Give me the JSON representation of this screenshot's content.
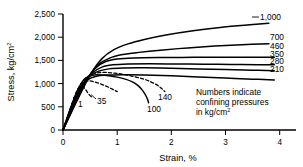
{
  "chart_data": {
    "type": "line",
    "title": "",
    "xlabel": "Strain, %",
    "ylabel": "Stress, kg/cm2",
    "ylabel_base": "Stress, kg/cm",
    "ylabel_sup": "2",
    "xlim": [
      0,
      4.3
    ],
    "ylim": [
      0,
      2600
    ],
    "xticks": [
      0,
      1,
      2,
      3,
      4
    ],
    "xticklabels": [
      "0",
      "1",
      "2",
      "3",
      "4"
    ],
    "yticks": [
      0,
      500,
      1000,
      1500,
      2000,
      2500
    ],
    "yticklabels": [
      "0",
      "500",
      "1,000",
      "1,500",
      "2,000",
      "2,500"
    ],
    "grid": false,
    "legend": "inline-labels-right",
    "annotation": {
      "line1": "Numbers indicate",
      "line2": "confining pressures",
      "line3_base": "in kg/cm",
      "line3_sup": "2"
    },
    "series": [
      {
        "name": "1",
        "label": "1",
        "confining_pressure": 1,
        "style": "dashed",
        "label_position": "inline-left",
        "points": [
          [
            0,
            0
          ],
          [
            0.12,
            420
          ],
          [
            0.2,
            700
          ],
          [
            0.26,
            880
          ],
          [
            0.3,
            950
          ],
          [
            0.34,
            980
          ],
          [
            0.38,
            960
          ],
          [
            0.42,
            900
          ],
          [
            0.46,
            830
          ],
          [
            0.5,
            770
          ],
          [
            0.54,
            730
          ]
        ]
      },
      {
        "name": "35",
        "label": "35",
        "confining_pressure": 35,
        "style": "dashed",
        "label_position": "inline-left",
        "points": [
          [
            0,
            0
          ],
          [
            0.14,
            500
          ],
          [
            0.24,
            830
          ],
          [
            0.32,
            1010
          ],
          [
            0.4,
            1080
          ],
          [
            0.48,
            1100
          ],
          [
            0.58,
            1080
          ],
          [
            0.7,
            1030
          ],
          [
            0.82,
            970
          ],
          [
            0.92,
            910
          ],
          [
            1.0,
            860
          ]
        ]
      },
      {
        "name": "100",
        "label": "100",
        "confining_pressure": 100,
        "style": "solid",
        "label_position": "inline-mid",
        "points": [
          [
            0,
            0
          ],
          [
            0.16,
            560
          ],
          [
            0.28,
            920
          ],
          [
            0.38,
            1120
          ],
          [
            0.48,
            1200
          ],
          [
            0.58,
            1235
          ],
          [
            0.7,
            1235
          ],
          [
            0.85,
            1215
          ],
          [
            1.0,
            1185
          ],
          [
            1.15,
            1140
          ],
          [
            1.28,
            1080
          ],
          [
            1.38,
            1000
          ],
          [
            1.46,
            900
          ],
          [
            1.52,
            790
          ],
          [
            1.56,
            690
          ],
          [
            1.58,
            610
          ]
        ]
      },
      {
        "name": "140",
        "label": "140",
        "confining_pressure": 140,
        "style": "dashed",
        "label_position": "inline-mid",
        "points": [
          [
            0,
            0
          ],
          [
            0.18,
            600
          ],
          [
            0.3,
            960
          ],
          [
            0.42,
            1160
          ],
          [
            0.54,
            1250
          ],
          [
            0.66,
            1285
          ],
          [
            0.8,
            1290
          ],
          [
            0.95,
            1275
          ],
          [
            1.12,
            1245
          ],
          [
            1.3,
            1200
          ],
          [
            1.48,
            1145
          ],
          [
            1.62,
            1080
          ],
          [
            1.74,
            1005
          ],
          [
            1.82,
            930
          ],
          [
            1.88,
            860
          ]
        ]
      },
      {
        "name": "210",
        "label": "210",
        "confining_pressure": 210,
        "style": "solid",
        "label_position": "right",
        "points": [
          [
            0,
            0
          ],
          [
            0.2,
            640
          ],
          [
            0.34,
            980
          ],
          [
            0.46,
            1130
          ],
          [
            0.6,
            1200
          ],
          [
            0.8,
            1230
          ],
          [
            1.1,
            1240
          ],
          [
            1.5,
            1235
          ],
          [
            2.0,
            1215
          ],
          [
            2.5,
            1190
          ],
          [
            3.0,
            1165
          ],
          [
            3.5,
            1140
          ],
          [
            3.9,
            1120
          ]
        ]
      },
      {
        "name": "280",
        "label": "280",
        "confining_pressure": 280,
        "style": "solid",
        "label_position": "right",
        "points": [
          [
            0,
            0
          ],
          [
            0.22,
            680
          ],
          [
            0.36,
            1030
          ],
          [
            0.5,
            1220
          ],
          [
            0.66,
            1320
          ],
          [
            0.85,
            1370
          ],
          [
            1.1,
            1390
          ],
          [
            1.5,
            1395
          ],
          [
            2.0,
            1385
          ],
          [
            2.5,
            1370
          ],
          [
            3.0,
            1355
          ],
          [
            3.5,
            1340
          ],
          [
            3.9,
            1330
          ]
        ]
      },
      {
        "name": "350",
        "label": "350",
        "confining_pressure": 350,
        "style": "solid",
        "label_position": "right",
        "points": [
          [
            0,
            0
          ],
          [
            0.24,
            700
          ],
          [
            0.4,
            1080
          ],
          [
            0.55,
            1290
          ],
          [
            0.72,
            1410
          ],
          [
            0.92,
            1460
          ],
          [
            1.2,
            1480
          ],
          [
            1.6,
            1485
          ],
          [
            2.1,
            1480
          ],
          [
            2.6,
            1475
          ],
          [
            3.1,
            1470
          ],
          [
            3.6,
            1465
          ],
          [
            3.9,
            1462
          ]
        ]
      },
      {
        "name": "460",
        "label": "460",
        "confining_pressure": 460,
        "style": "solid",
        "label_position": "right",
        "points": [
          [
            0,
            0
          ],
          [
            0.26,
            720
          ],
          [
            0.44,
            1140
          ],
          [
            0.6,
            1390
          ],
          [
            0.78,
            1530
          ],
          [
            1.0,
            1590
          ],
          [
            1.3,
            1615
          ],
          [
            1.8,
            1625
          ],
          [
            2.4,
            1628
          ],
          [
            3.0,
            1628
          ],
          [
            3.5,
            1628
          ],
          [
            3.9,
            1628
          ]
        ]
      },
      {
        "name": "700",
        "label": "700",
        "confining_pressure": 700,
        "style": "solid",
        "label_position": "right",
        "points": [
          [
            0,
            0
          ],
          [
            0.28,
            740
          ],
          [
            0.48,
            1200
          ],
          [
            0.66,
            1470
          ],
          [
            0.86,
            1610
          ],
          [
            1.1,
            1690
          ],
          [
            1.4,
            1740
          ],
          [
            1.8,
            1790
          ],
          [
            2.3,
            1840
          ],
          [
            2.8,
            1880
          ],
          [
            3.3,
            1910
          ],
          [
            3.8,
            1935
          ]
        ]
      },
      {
        "name": "1,000",
        "label": "1,000",
        "confining_pressure": 1000,
        "style": "solid",
        "label_position": "right-top",
        "points": [
          [
            0,
            0
          ],
          [
            0.3,
            760
          ],
          [
            0.52,
            1270
          ],
          [
            0.72,
            1600
          ],
          [
            0.94,
            1800
          ],
          [
            1.2,
            1930
          ],
          [
            1.5,
            2030
          ],
          [
            1.9,
            2130
          ],
          [
            2.4,
            2225
          ],
          [
            2.9,
            2300
          ],
          [
            3.4,
            2355
          ],
          [
            3.8,
            2395
          ]
        ]
      }
    ]
  }
}
